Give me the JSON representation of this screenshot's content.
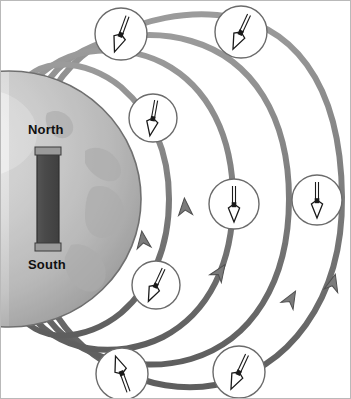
{
  "figure": {
    "background_color": "#ffffff",
    "border_color": "#b9b9b9",
    "width": 351,
    "height": 399
  },
  "earth": {
    "label_north": "North",
    "label_south": "South",
    "center_x": 8,
    "center_y": 198,
    "radius_x": 132,
    "radius_y": 128,
    "fill_light": "#e6e6e6",
    "fill_mid": "#c9c9c9",
    "fill_dark": "#a8a8a8",
    "outline_color": "#6f6f6f"
  },
  "bar_magnet": {
    "x": 36,
    "y": 148,
    "width": 22,
    "height": 100,
    "body_color": "#4a4a4a",
    "cap_color": "#9a9a9a",
    "outline_color": "#3a3a3a"
  },
  "field_lines": {
    "stroke_color": "#7b7b7b",
    "stroke_highlight": "#9e9e9e",
    "stroke_shadow": "#5c5c5c",
    "stroke_width": 6,
    "count": 5,
    "direction_arrow_label": "field-direction-arrow",
    "arrow_count": 5
  },
  "compasses": [
    {
      "id": "compass-top-left",
      "cx": 120,
      "cy": 33,
      "r": 26,
      "needle_angle_deg": -160,
      "position_label": "upper left arc"
    },
    {
      "id": "compass-top-right",
      "cx": 240,
      "cy": 31,
      "r": 26,
      "needle_angle_deg": -155,
      "position_label": "upper right arc"
    },
    {
      "id": "compass-inner-upper",
      "cx": 152,
      "cy": 117,
      "r": 24,
      "needle_angle_deg": -170,
      "position_label": "inner upper arc"
    },
    {
      "id": "compass-mid-right",
      "cx": 233,
      "cy": 203,
      "r": 25,
      "needle_angle_deg": 180,
      "position_label": "middle right"
    },
    {
      "id": "compass-far-right",
      "cx": 316,
      "cy": 199,
      "r": 25,
      "needle_angle_deg": 180,
      "position_label": "far right"
    },
    {
      "id": "compass-inner-lower",
      "cx": 155,
      "cy": 284,
      "r": 24,
      "needle_angle_deg": -155,
      "position_label": "inner lower arc"
    },
    {
      "id": "compass-bottom-left",
      "cx": 121,
      "cy": 373,
      "r": 26,
      "needle_angle_deg": -20,
      "position_label": "lower left arc"
    },
    {
      "id": "compass-bottom-right",
      "cx": 238,
      "cy": 371,
      "r": 26,
      "needle_angle_deg": -155,
      "position_label": "lower right arc"
    }
  ],
  "compass_style": {
    "face_color": "#ffffff",
    "rim_color": "#6b6b6b",
    "needle_fill": "#ffffff",
    "needle_outline": "#1a1a1a",
    "pivot_color": "#1a1a1a"
  }
}
